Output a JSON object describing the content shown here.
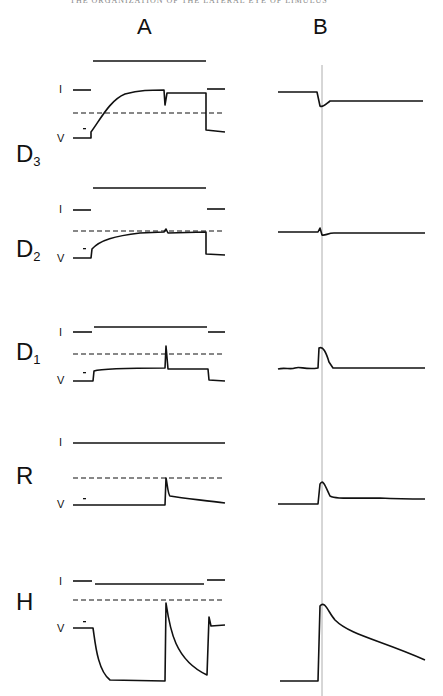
{
  "running_head": "THE ORGANIZATION OF THE LATERAL EYE OF LIMULUS",
  "page_number": "",
  "columns": [
    {
      "label": "A",
      "x": 144
    },
    {
      "label": "B",
      "x": 320
    }
  ],
  "trace_labels": {
    "current": "I",
    "voltage": "V"
  },
  "rows": [
    {
      "id": "D3",
      "main": "D",
      "sub": "3",
      "top": 140
    },
    {
      "id": "D2",
      "main": "D",
      "sub": "2",
      "top": 235
    },
    {
      "id": "D1",
      "main": "D",
      "sub": "1",
      "top": 338
    },
    {
      "id": "R",
      "main": "R",
      "sub": "",
      "top": 462
    },
    {
      "id": "H",
      "main": "H",
      "sub": "",
      "top": 588
    }
  ],
  "colors": {
    "ink": "#111111",
    "reference_line": "#999999"
  }
}
